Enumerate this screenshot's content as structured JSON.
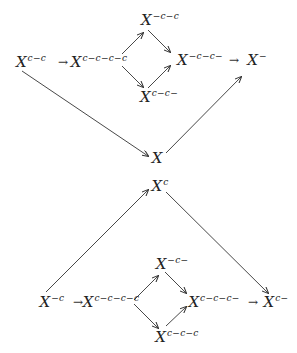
{
  "top_diagram": {
    "nodes": {
      "A": {
        "base": "X",
        "sup": "c−c"
      },
      "B": {
        "base": "X",
        "sup": "c−c−c−c"
      },
      "C": {
        "base": "X",
        "sup": "−c−c"
      },
      "D": {
        "base": "X",
        "sup": "c−c−"
      },
      "E": {
        "base": "X",
        "sup": "−c−c−"
      },
      "F": {
        "base": "X",
        "sup": "−"
      },
      "G": {
        "base": "X",
        "sup": ""
      }
    },
    "arrows": [
      {
        "from": "A",
        "to": "B"
      },
      {
        "from": "B",
        "to": "C"
      },
      {
        "from": "B",
        "to": "D"
      },
      {
        "from": "C",
        "to": "E"
      },
      {
        "from": "D",
        "to": "E"
      },
      {
        "from": "E",
        "to": "F"
      },
      {
        "from": "A",
        "to": "G"
      },
      {
        "from": "G",
        "to": "F"
      }
    ]
  },
  "bottom_diagram": {
    "nodes": {
      "H": {
        "base": "X",
        "sup": "c"
      },
      "I": {
        "base": "X",
        "sup": "−c"
      },
      "J": {
        "base": "X",
        "sup": "c−c−c−c"
      },
      "K": {
        "base": "X",
        "sup": "−c−"
      },
      "L": {
        "base": "X",
        "sup": "c−c−c"
      },
      "M": {
        "base": "X",
        "sup": "c−c−c−"
      },
      "N": {
        "base": "X",
        "sup": "c−"
      }
    },
    "arrows": [
      {
        "from": "I",
        "to": "J"
      },
      {
        "from": "J",
        "to": "K"
      },
      {
        "from": "J",
        "to": "L"
      },
      {
        "from": "K",
        "to": "M"
      },
      {
        "from": "L",
        "to": "M"
      },
      {
        "from": "M",
        "to": "N"
      },
      {
        "from": "I",
        "to": "H"
      },
      {
        "from": "H",
        "to": "N"
      }
    ]
  },
  "arrow_glyph": "→"
}
